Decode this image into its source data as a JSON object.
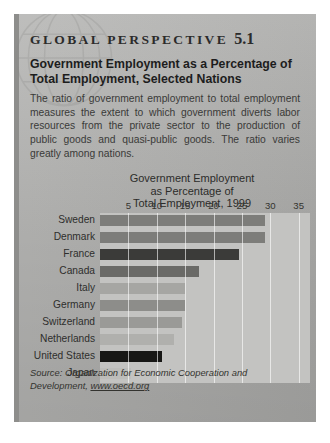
{
  "box": {
    "kicker": "GLOBAL PERSPECTIVE",
    "kicker_number": "5.1",
    "headline": "Government Employment as a Percentage of Total Employment, Selected Nations",
    "body": "The ratio of government employment to total employment measures the extent to which government diverts labor resources from the private sector to the production of public goods and quasi-public goods. The ratio varies greatly among nations.",
    "source_label": "Source: Organization for Economic Cooperation and Development,",
    "source_url": "www.oecd.org",
    "globe_icon": "globe-watermark-icon"
  },
  "colors": {
    "panel": "#b2b2b0",
    "plot": "#c3c3c1",
    "accent_bar": "#8e8e8c",
    "gridline": "#ffffff",
    "text": "#2b2b2b"
  },
  "chart_data": {
    "type": "bar",
    "orientation": "horizontal",
    "title": "Government Employment as Percentage of Total Employment, 1999",
    "title_lines": [
      "Government Employment",
      "as Percentage of",
      "Total Employment, 1999"
    ],
    "xlabel": "",
    "ylabel": "",
    "xlim": [
      0,
      37
    ],
    "ticks": [
      5,
      10,
      15,
      20,
      25,
      30,
      35
    ],
    "grid": true,
    "legend": "none",
    "categories": [
      "Sweden",
      "Denmark",
      "France",
      "Canada",
      "Italy",
      "Germany",
      "Switzerland",
      "Netherlands",
      "United States",
      "Japan"
    ],
    "values": [
      29,
      29,
      24.5,
      17.5,
      15,
      15,
      14.5,
      13,
      11,
      5.5
    ],
    "bar_colors": [
      "#7d7d7a",
      "#7d7d7a",
      "#3b3b39",
      "#6a6a67",
      "#a6a6a3",
      "#8d8d8a",
      "#9a9a97",
      "#b0b0ad",
      "#171715",
      "#bdbdba"
    ]
  }
}
